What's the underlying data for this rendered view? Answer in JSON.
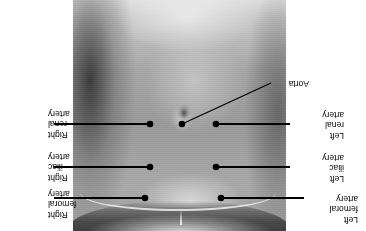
{
  "figure": {
    "orientation": "rotated-180",
    "background_color": "#ffffff",
    "line_color": "#000000",
    "text_color": "#000000"
  },
  "photo": {
    "alt": "Grayscale photograph of a human torso, anterior abdominal wall",
    "left": 80,
    "top": 0,
    "width": 213,
    "height": 231
  },
  "labels": [
    {
      "id": "left-femoral-artery",
      "lines": [
        "Left",
        "femoral",
        "artery"
      ],
      "side": "left",
      "text_x": 8,
      "text_y": 6,
      "dot_x": 145,
      "dot_y": 33,
      "leader": "horizontal"
    },
    {
      "id": "left-iliac-artery",
      "lines": [
        "Left",
        "iliac",
        "artery"
      ],
      "side": "left",
      "text_x": 22,
      "text_y": 47,
      "dot_x": 150,
      "dot_y": 64,
      "leader": "horizontal"
    },
    {
      "id": "left-renal-artery",
      "lines": [
        "Left",
        "renal",
        "artery"
      ],
      "side": "left",
      "text_x": 22,
      "text_y": 90,
      "dot_x": 150,
      "dot_y": 107,
      "leader": "horizontal"
    },
    {
      "id": "aorta",
      "lines": [
        "Aorta"
      ],
      "side": "left",
      "text_x": 57,
      "text_y": 142,
      "dot_x": 184,
      "dot_y": 107,
      "leader": "diagonal"
    },
    {
      "id": "right-femoral-artery",
      "lines": [
        "Right",
        "femoral",
        "artery"
      ],
      "side": "right",
      "text_x": 318,
      "text_y": 11,
      "dot_x": 221,
      "dot_y": 33,
      "leader": "horizontal"
    },
    {
      "id": "right-iliac-artery",
      "lines": [
        "Right",
        "iliac",
        "artery"
      ],
      "side": "right",
      "text_x": 318,
      "text_y": 48,
      "dot_x": 216,
      "dot_y": 64,
      "leader": "horizontal"
    },
    {
      "id": "right-renal-artery",
      "lines": [
        "Right",
        "renal",
        "artery"
      ],
      "side": "right",
      "text_x": 318,
      "text_y": 91,
      "dot_x": 216,
      "dot_y": 107,
      "leader": "horizontal"
    }
  ],
  "label_text": {
    "left_femoral_artery": "Left\nfemoral\nartery",
    "left_iliac_artery": "Left\niliac\nartery",
    "left_renal_artery": "Left\nrenal\nartery",
    "aorta": "Aorta",
    "right_femoral_artery": "Right\nfemoral\nartery",
    "right_iliac_artery": "Right\niliac\nartery",
    "right_renal_artery": "Right\nrenal\nartery"
  }
}
